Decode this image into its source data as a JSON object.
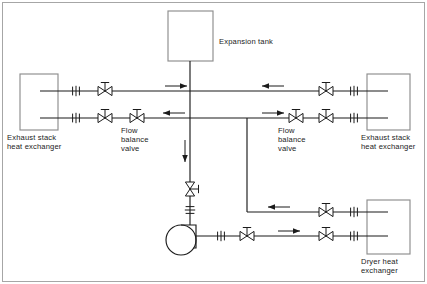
{
  "diagram": {
    "type": "piping-and-instrumentation-diagram",
    "canvas": {
      "width": 427,
      "height": 284
    },
    "stroke_color": "#1b1b1b",
    "background_color": "#ffffff",
    "border": {
      "visible": true,
      "color": "#9a9a9a"
    }
  },
  "labels": {
    "expansion_tank": "Expansion tank",
    "flow_balance_valve_left": "Flow\nbalance\nvalve",
    "flow_balance_valve_right": "Flow\nbalance\nvalve",
    "exhaust_stack_heat_exchanger_left": "Exhaust stack\nheat exchanger",
    "exhaust_stack_heat_exchanger_right": "Exhaust stack\nheat exchanger",
    "dryer_heat_exchanger": "Dryer heat\nexchanger"
  },
  "equipment": [
    {
      "id": "expansion-tank",
      "name": "Expansion tank",
      "shape": "rect",
      "x": 168,
      "y": 11,
      "w": 45,
      "h": 50
    },
    {
      "id": "exhaust-stack-hx-left",
      "name": "Exhaust stack heat exchanger",
      "shape": "rect",
      "x": 20,
      "y": 74,
      "w": 38,
      "h": 56
    },
    {
      "id": "exhaust-stack-hx-right",
      "name": "Exhaust stack heat exchanger",
      "shape": "rect",
      "x": 367,
      "y": 74,
      "w": 43,
      "h": 56
    },
    {
      "id": "dryer-hx",
      "name": "Dryer heat exchanger",
      "shape": "rect",
      "x": 367,
      "y": 200,
      "w": 43,
      "h": 54
    },
    {
      "id": "circulating-pump",
      "name": "Circulating pump",
      "shape": "circle",
      "cx": 181,
      "cy": 240,
      "r": 15
    }
  ],
  "valves": [
    {
      "id": "v-top-left",
      "type": "gate-valve",
      "x": 105,
      "y": 91,
      "handwheel": true
    },
    {
      "id": "v-top-right",
      "type": "gate-valve",
      "x": 326,
      "y": 91,
      "handwheel": true
    },
    {
      "id": "v-mid-left-a",
      "type": "gate-valve",
      "x": 105,
      "y": 118,
      "handwheel": true
    },
    {
      "id": "v-mid-left-b",
      "type": "gate-valve",
      "x": 137,
      "y": 118,
      "handwheel": true
    },
    {
      "id": "v-mid-right-a",
      "type": "gate-valve",
      "x": 296,
      "y": 118,
      "handwheel": true
    },
    {
      "id": "v-mid-right-b",
      "type": "gate-valve",
      "x": 326,
      "y": 118,
      "handwheel": true
    },
    {
      "id": "v-dryer-return",
      "type": "gate-valve",
      "x": 326,
      "y": 212,
      "handwheel": true
    },
    {
      "id": "v-pump-disch-a",
      "type": "gate-valve",
      "x": 247,
      "y": 236,
      "handwheel": true
    },
    {
      "id": "v-pump-disch-b",
      "type": "gate-valve",
      "x": 326,
      "y": 236,
      "handwheel": true
    },
    {
      "id": "v-suction-globe",
      "type": "globe-valve-vertical",
      "x": 190,
      "y": 189,
      "handwheel": true
    }
  ],
  "unions": [
    {
      "id": "u-top-left",
      "x": 76,
      "y": 91
    },
    {
      "id": "u-top-right",
      "x": 354,
      "y": 91
    },
    {
      "id": "u-mid-left",
      "x": 76,
      "y": 118
    },
    {
      "id": "u-mid-right",
      "x": 354,
      "y": 118
    },
    {
      "id": "u-dryer-return",
      "x": 354,
      "y": 212
    },
    {
      "id": "u-pump-disch",
      "x": 221,
      "y": 236
    },
    {
      "id": "u-pump-disch-2",
      "x": 354,
      "y": 236
    },
    {
      "id": "u-pump-suction",
      "x": 190,
      "y": 210
    }
  ],
  "flow_arrows": [
    {
      "id": "arrow-top-left",
      "x": 165,
      "y": 86,
      "direction": "right"
    },
    {
      "id": "arrow-top-right",
      "x": 262,
      "y": 86,
      "direction": "left"
    },
    {
      "id": "arrow-mid-left",
      "x": 163,
      "y": 113,
      "direction": "left"
    },
    {
      "id": "arrow-mid-right",
      "x": 262,
      "y": 113,
      "direction": "right"
    },
    {
      "id": "arrow-center-down",
      "x": 190,
      "y": 140,
      "direction": "down"
    },
    {
      "id": "arrow-dryer-return",
      "x": 268,
      "y": 207,
      "direction": "left"
    },
    {
      "id": "arrow-pump-disch",
      "x": 278,
      "y": 231,
      "direction": "right"
    }
  ]
}
